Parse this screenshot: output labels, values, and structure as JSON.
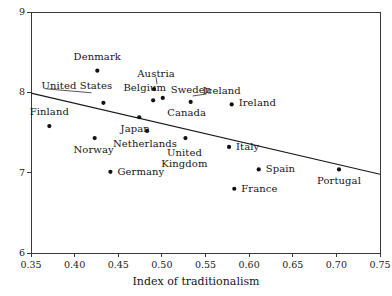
{
  "chart_data": {
    "type": "scatter",
    "title": "",
    "xlabel": "Index of traditionalism",
    "ylabel": "",
    "xlim": [
      0.35,
      0.75
    ],
    "ylim": [
      6,
      9
    ],
    "xticks": [
      "0.35",
      "0.40",
      "0.45",
      "0.50",
      "0.55",
      "0.60",
      "0.65",
      "0.70",
      "0.75"
    ],
    "xtick_values": [
      0.35,
      0.4,
      0.45,
      0.5,
      0.55,
      0.6,
      0.65,
      0.7,
      0.75
    ],
    "yticks": [
      "6",
      "7",
      "8",
      "9"
    ],
    "ytick_values": [
      6,
      7,
      8,
      9
    ],
    "grid": false,
    "legend": "none",
    "points": [
      {
        "label": "Denmark",
        "x": 0.426,
        "y": 8.27,
        "label_dx": 0,
        "label_dy": -13,
        "anchor": "middle",
        "leader": false
      },
      {
        "label": "United States",
        "x": 0.433,
        "y": 7.87,
        "label_dx": -62,
        "label_dy": -16,
        "anchor": "start",
        "leader": true,
        "leader_from_dx": -12,
        "leader_from_dy": -10
      },
      {
        "label": "Belgium",
        "x": 0.433,
        "y": 7.87,
        "label_dx": 20,
        "label_dy": -14,
        "anchor": "start",
        "leader": false
      },
      {
        "label": "Austria",
        "x": 0.491,
        "y": 8.04,
        "label_dx": 2,
        "label_dy": -14,
        "anchor": "middle",
        "leader": true,
        "leader_from_dx": 3,
        "leader_from_dy": -5
      },
      {
        "label": "Sweden",
        "x": 0.501,
        "y": 7.93,
        "label_dx": 8,
        "label_dy": -7,
        "anchor": "start",
        "leader": false
      },
      {
        "label": "Iceland",
        "x": 0.533,
        "y": 7.88,
        "label_dx": 12,
        "label_dy": -10,
        "anchor": "start",
        "leader": true,
        "leader_from_dx": 2,
        "leader_from_dy": -6
      },
      {
        "label": "Ireland",
        "x": 0.58,
        "y": 7.85,
        "label_dx": 7,
        "label_dy": 0,
        "anchor": "start",
        "leader": false
      },
      {
        "label": "Canada",
        "x": 0.49,
        "y": 7.9,
        "label_dx": 14,
        "label_dy": 14,
        "anchor": "start",
        "leader": false
      },
      {
        "label": "Finland",
        "x": 0.371,
        "y": 7.58,
        "label_dx": 0,
        "label_dy": -13,
        "anchor": "middle",
        "leader": false
      },
      {
        "label": "Japan",
        "x": 0.474,
        "y": 7.69,
        "label_dx": -4,
        "label_dy": 13,
        "anchor": "middle",
        "leader": false
      },
      {
        "label": "Norway",
        "x": 0.423,
        "y": 7.43,
        "label_dx": -1,
        "label_dy": 13,
        "anchor": "middle",
        "leader": false
      },
      {
        "label": "Netherlands",
        "x": 0.483,
        "y": 7.52,
        "label_dx": -2,
        "label_dy": 14,
        "anchor": "middle",
        "leader": false
      },
      {
        "label": "United Kingdom",
        "x": 0.527,
        "y": 7.43,
        "label_dx": -1,
        "label_dy": 16,
        "anchor": "middle",
        "leader": false,
        "two_line": true
      },
      {
        "label": "Italy",
        "x": 0.577,
        "y": 7.32,
        "label_dx": 7,
        "label_dy": 1,
        "anchor": "start",
        "leader": false
      },
      {
        "label": "Germany",
        "x": 0.441,
        "y": 7.01,
        "label_dx": 7,
        "label_dy": 1,
        "anchor": "start",
        "leader": false
      },
      {
        "label": "Spain",
        "x": 0.611,
        "y": 7.04,
        "label_dx": 7,
        "label_dy": 1,
        "anchor": "start",
        "leader": false
      },
      {
        "label": "France",
        "x": 0.583,
        "y": 6.8,
        "label_dx": 7,
        "label_dy": 1,
        "anchor": "start",
        "leader": false
      },
      {
        "label": "Portugal",
        "x": 0.703,
        "y": 7.04,
        "label_dx": 0,
        "label_dy": 13,
        "anchor": "middle",
        "leader": false
      }
    ],
    "trendline": {
      "x0": 0.35,
      "y0": 7.99,
      "x1": 0.75,
      "y1": 6.98
    }
  },
  "colors": {
    "point": "#111111",
    "axis": "#3a3a3a",
    "trend": "#1a1a1a",
    "background": "#ffffff",
    "text": "#161616"
  }
}
